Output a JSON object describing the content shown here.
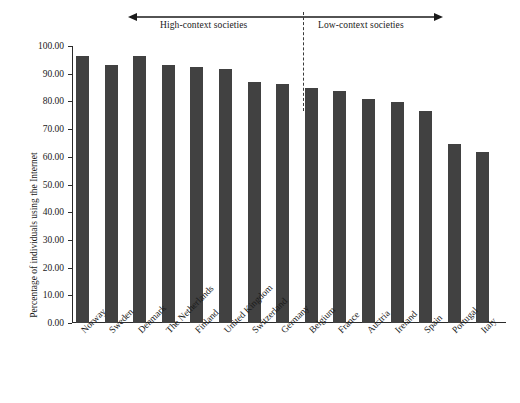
{
  "chart_data": {
    "type": "bar",
    "title": "",
    "subtitle": "",
    "xlabel": "",
    "ylabel": "Percentage of individuals using the Internet",
    "ylim": [
      0,
      100
    ],
    "ytick_labels": [
      "0.00",
      "10.00",
      "20.00",
      "30.00",
      "40.00",
      "50.00",
      "60.00",
      "70.00",
      "80.00",
      "90.00",
      "100.00"
    ],
    "ytick_values": [
      0,
      10,
      20,
      30,
      40,
      50,
      60,
      70,
      80,
      90,
      100
    ],
    "grid": false,
    "legend_position": "none",
    "bar_color": "#414141",
    "categories": [
      "Norway",
      "Sweden",
      "Denmark",
      "The Netherlands",
      "Finland",
      "United Kingdom",
      "Switzerland",
      "Germany",
      "Belgium",
      "France",
      "Austria",
      "Ireland",
      "Spain",
      "Portugal",
      "Italy"
    ],
    "values": [
      96.5,
      93.0,
      96.3,
      93.3,
      92.4,
      91.6,
      87.0,
      86.2,
      85.0,
      83.6,
      81.0,
      79.7,
      76.4,
      64.6,
      61.9
    ],
    "annotations": [
      {
        "name": "high-context-societies",
        "text": "High-context societies",
        "arrow": "left",
        "span_start_x": 128,
        "span_end_x": 303
      },
      {
        "name": "low-context-societies",
        "text": "Low-context societies",
        "arrow": "right",
        "span_start_x": 303,
        "span_end_x": 443
      }
    ],
    "divider": {
      "name": "context-divider",
      "style": "dashed",
      "between": [
        "Germany",
        "Belgium"
      ]
    }
  }
}
